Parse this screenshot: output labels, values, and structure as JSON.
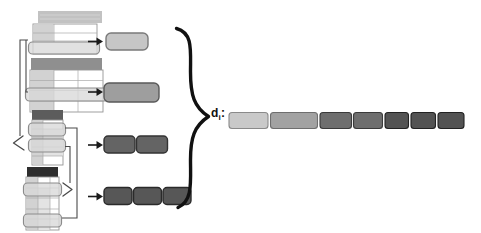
{
  "diagram": {
    "vector_label": {
      "base": "d",
      "subscript": "i",
      "separator": ":"
    },
    "colors": {
      "background": "#ffffff",
      "connector": "#4a4a4a",
      "arrow": "#1a1a1a",
      "brace": "#111111",
      "table_border": "#949494",
      "table_cell_fill": "#d2d2d2",
      "table_cell_light": "#e3e3e3",
      "highlight_fill": "#d8d8d8",
      "highlight_border": "#8c8c8c"
    },
    "tables": [
      {
        "name": "table-1",
        "shade": "light",
        "header_color": "#c2c2c2",
        "highlighted_rows": 1
      },
      {
        "name": "table-2",
        "shade": "medium",
        "header_color": "#8f8f8f",
        "highlighted_rows": 1
      },
      {
        "name": "table-3",
        "shade": "dark",
        "header_color": "#5c5c5c",
        "highlighted_rows": 2
      },
      {
        "name": "table-4",
        "shade": "darkest",
        "header_color": "#2e2e2e",
        "highlighted_rows": 2
      }
    ],
    "feature_blocks": [
      {
        "source_table": "table-1",
        "count": 1,
        "fill": "#c6c6c6",
        "border": "#7a7a7a"
      },
      {
        "source_table": "table-2",
        "count": 1,
        "fill": "#9e9e9e",
        "border": "#5a5a5a"
      },
      {
        "source_table": "table-3",
        "count": 2,
        "fill": "#646464",
        "border": "#333333"
      },
      {
        "source_table": "table-4",
        "count": 3,
        "fill": "#575757",
        "border": "#2a2a2a"
      }
    ],
    "vector_segments": [
      {
        "fill": "#c9c9c9",
        "border": "#8a8a8a"
      },
      {
        "fill": "#a2a2a2",
        "border": "#6e6e6e"
      },
      {
        "fill": "#6e6e6e",
        "border": "#3a3a3a"
      },
      {
        "fill": "#6e6e6e",
        "border": "#3a3a3a"
      },
      {
        "fill": "#535353",
        "border": "#222222"
      },
      {
        "fill": "#535353",
        "border": "#222222"
      },
      {
        "fill": "#535353",
        "border": "#222222"
      }
    ]
  }
}
